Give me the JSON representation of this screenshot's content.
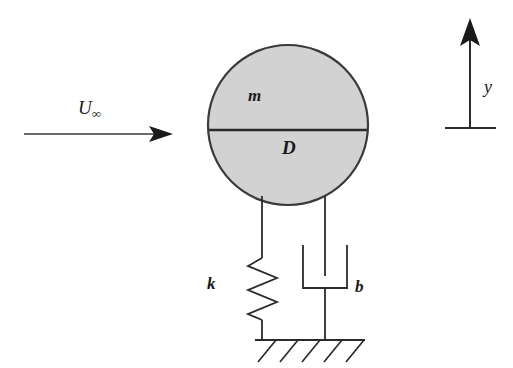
{
  "figure": {
    "type": "engineering-schematic",
    "background_color": "#ffffff",
    "line_color": "#2b2b2b",
    "body_fill_color": "#d2d2d2"
  },
  "labels": {
    "freestream_symbol": "U",
    "freestream_subscript": "∞",
    "mass": "m",
    "diameter": "D",
    "spring_constant": "k",
    "damping_constant": "b",
    "displacement_axis": "y"
  },
  "elements": {
    "flow_arrow": {
      "name": "freestream-velocity-arrow",
      "direction": "right",
      "x_start": 24,
      "x_end": 172,
      "y": 134
    },
    "cylinder": {
      "name": "cylinder-body",
      "center_x": 288,
      "center_y": 125,
      "radius": 80,
      "diameter_line_y": 130
    },
    "spring": {
      "name": "spring-element",
      "x": 262,
      "top_y": 205,
      "bottom_y": 340,
      "coils": 5
    },
    "damper": {
      "name": "damper-element",
      "x": 325,
      "top_y": 205,
      "bottom_y": 340,
      "cylinder_top_y": 245,
      "cylinder_bottom_y": 288,
      "cylinder_half_width": 26
    },
    "ground": {
      "name": "ground-support",
      "x_start": 255,
      "x_end": 365,
      "y": 340,
      "hatch_count": 5
    },
    "axis_arrow": {
      "name": "y-axis-arrow",
      "x": 470,
      "y_base": 128,
      "y_tip": 20,
      "base_x_start": 445,
      "base_x_end": 496
    }
  }
}
